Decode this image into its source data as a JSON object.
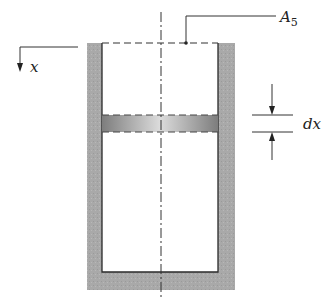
{
  "diagram": {
    "labels": {
      "area": "A",
      "area_subscript": "5",
      "axis": "x",
      "thickness": "dx"
    },
    "colors": {
      "wall": "#a8a8a8",
      "slice_edge": "#8a8a8a",
      "slice_center": "#d8d8d8",
      "line": "#2a2a2a"
    }
  }
}
